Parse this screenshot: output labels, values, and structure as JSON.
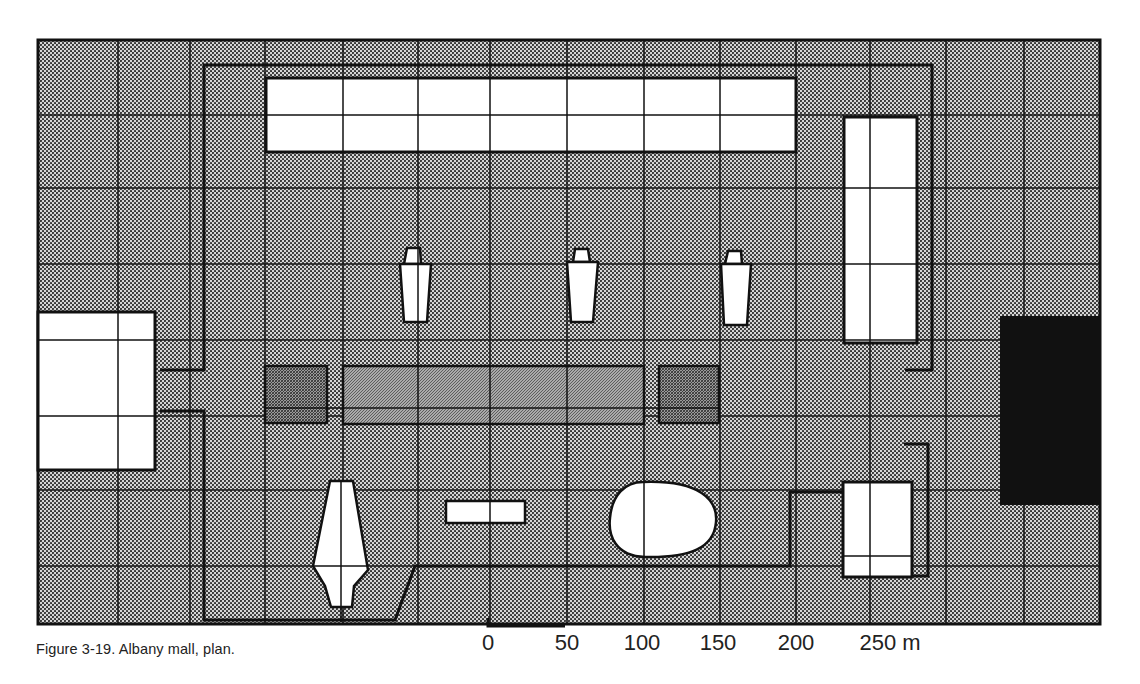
{
  "figure": {
    "caption": "Figure 3-19.  Albany mall, plan.",
    "background_pattern": "dotted-halftone",
    "colors": {
      "paper": "#ffffff",
      "ink": "#1a1a1a",
      "halftone_dot": "#2a2a2a",
      "halftone_bg": "#cfcfcf",
      "dark_block": "#111111",
      "cross_hatch": "#7a7a7a"
    }
  },
  "scale_bar": {
    "labels": [
      "0",
      "50",
      "100",
      "150",
      "200",
      "250 m"
    ],
    "x_positions": [
      488,
      565,
      642,
      718,
      795,
      895
    ]
  },
  "grid": {
    "columns_x": [
      38,
      118,
      190,
      265,
      343,
      418,
      490,
      567,
      644,
      720,
      796,
      870,
      946,
      1024,
      1100
    ],
    "rows_y": [
      40,
      115,
      188,
      264,
      340,
      416,
      490,
      566,
      624
    ]
  },
  "buildings": [
    {
      "id": "north-long-block",
      "type": "white-rect"
    },
    {
      "id": "east-tall-block",
      "type": "white-rect"
    },
    {
      "id": "west-square-block",
      "type": "white-rect"
    },
    {
      "id": "tower-1",
      "type": "white-tower"
    },
    {
      "id": "tower-2",
      "type": "white-tower"
    },
    {
      "id": "tower-3",
      "type": "white-tower"
    },
    {
      "id": "central-pool-left",
      "type": "cross-hatched"
    },
    {
      "id": "central-pool-middle",
      "type": "cross-hatched"
    },
    {
      "id": "central-pool-right",
      "type": "cross-hatched"
    },
    {
      "id": "tapered-tower-south",
      "type": "white-tower"
    },
    {
      "id": "small-pavilion",
      "type": "white-rect"
    },
    {
      "id": "egg-auditorium",
      "type": "white-oval"
    },
    {
      "id": "southeast-block",
      "type": "white-rect"
    },
    {
      "id": "east-dark-block",
      "type": "solid-dark"
    }
  ]
}
